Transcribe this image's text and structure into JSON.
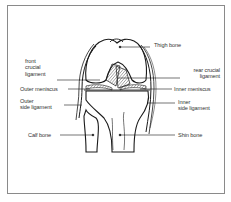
{
  "diagram": {
    "colors": {
      "line": "#1a1a1a",
      "frame": "#8a8a8a",
      "hatch": "#555555",
      "text": "#333333"
    },
    "labels": {
      "thigh_bone": "Thigh bone",
      "front_crucial_ligament": "front\ncrucial\nligament",
      "rear_crucial_ligament": "rear crucial\nligament",
      "outer_meniscus": "Outer meniscus",
      "inner_meniscus": "Inner meniscus",
      "outer_side_ligament": "Outer\nside ligament",
      "inner_side_ligament": "Inner\nside ligament",
      "calf_bone": "Calf bone",
      "shin_bone": "Shin bone"
    }
  }
}
